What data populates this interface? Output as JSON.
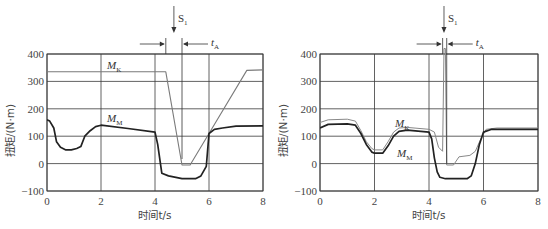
{
  "chart_data": [
    {
      "id": "left",
      "type": "line",
      "title": "",
      "xlabel": "时间t/s",
      "ylabel": "扭矩/(N·m)",
      "xlim": [
        0,
        8
      ],
      "ylim": [
        -100,
        400
      ],
      "xticks": [
        0,
        2,
        4,
        6,
        8
      ],
      "yticks": [
        -100,
        0,
        100,
        200,
        300,
        400
      ],
      "grid": true,
      "annotations": {
        "switch_label": "S1",
        "switch_time": 4.7,
        "interval_label": "tA",
        "interval_start": 4.4,
        "interval_end": 5.0
      },
      "series": [
        {
          "name": "MK",
          "label_main": "M",
          "label_sub": "K",
          "color": "#7a7a7a",
          "x": [
            0,
            4.4,
            5.0,
            5.3,
            6.0,
            7.4,
            8.0
          ],
          "y": [
            335,
            335,
            -5,
            -5,
            110,
            340,
            342
          ]
        },
        {
          "name": "MM",
          "label_main": "M",
          "label_sub": "M",
          "color": "#222222",
          "x": [
            0,
            0.1,
            0.25,
            0.35,
            0.5,
            0.7,
            0.9,
            1.1,
            1.25,
            1.4,
            1.6,
            1.8,
            2.0,
            3.0,
            4.0,
            4.1,
            4.25,
            4.5,
            5.0,
            5.5,
            5.7,
            5.9,
            6.0,
            6.2,
            6.5,
            7.0,
            8.0
          ],
          "y": [
            160,
            155,
            130,
            80,
            60,
            50,
            50,
            55,
            62,
            100,
            120,
            135,
            140,
            128,
            115,
            70,
            -35,
            -45,
            -55,
            -55,
            -45,
            -10,
            110,
            125,
            130,
            137,
            138
          ]
        }
      ]
    },
    {
      "id": "right",
      "type": "line",
      "title": "",
      "xlabel": "时间t/s",
      "ylabel": "扭矩/(N·m)",
      "xlim": [
        0,
        8
      ],
      "ylim": [
        -100,
        400
      ],
      "xticks": [
        0,
        2,
        4,
        6,
        8
      ],
      "yticks": [
        -100,
        0,
        100,
        200,
        300,
        400
      ],
      "grid": true,
      "annotations": {
        "switch_label": "S1",
        "switch_time": 4.55,
        "interval_label": "tA",
        "interval_start": 4.5,
        "interval_end": 4.65
      },
      "series": [
        {
          "name": "MK",
          "label_main": "M",
          "label_sub": "K",
          "color": "#888888",
          "x": [
            0,
            0.3,
            1.0,
            1.3,
            1.5,
            1.7,
            1.9,
            2.0,
            2.3,
            2.5,
            2.7,
            2.9,
            3.2,
            4.0,
            4.2,
            4.35,
            4.5,
            4.55,
            4.6,
            4.65,
            4.9,
            5.1,
            5.5,
            5.7,
            5.9,
            6.1,
            6.5,
            8.0
          ],
          "y": [
            150,
            160,
            162,
            155,
            120,
            80,
            55,
            50,
            50,
            80,
            115,
            130,
            132,
            125,
            115,
            60,
            45,
            420,
            420,
            -5,
            -5,
            25,
            30,
            45,
            90,
            125,
            130,
            130
          ]
        },
        {
          "name": "MM",
          "label_main": "M",
          "label_sub": "M",
          "color": "#222222",
          "x": [
            0,
            0.3,
            1.0,
            1.3,
            1.5,
            1.7,
            1.9,
            2.0,
            2.3,
            2.5,
            2.7,
            2.9,
            3.2,
            4.0,
            4.1,
            4.2,
            4.3,
            4.4,
            4.6,
            5.4,
            5.55,
            5.7,
            5.85,
            6.0,
            6.3,
            8.0
          ],
          "y": [
            130,
            143,
            145,
            140,
            110,
            70,
            42,
            38,
            38,
            65,
            100,
            118,
            122,
            115,
            90,
            20,
            -30,
            -50,
            -55,
            -55,
            -45,
            0,
            70,
            115,
            125,
            125
          ]
        }
      ]
    }
  ]
}
